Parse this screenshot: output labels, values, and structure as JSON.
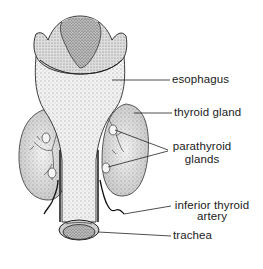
{
  "diagram": {
    "labels": {
      "esophagus": "esophagus",
      "thyroid_gland": "thyroid gland",
      "parathyroid_line1": "parathyroid",
      "parathyroid_line2": "glands",
      "inferior_artery_line1": "inferior thyroid",
      "inferior_artery_line2": "artery",
      "trachea": "trachea"
    },
    "colors": {
      "ink": "#1a1a1a",
      "stipple_light": "#d9d9d9",
      "stipple_mid": "#b0b0b0",
      "stipple_dark": "#5a5a5a",
      "background": "#ffffff"
    }
  }
}
